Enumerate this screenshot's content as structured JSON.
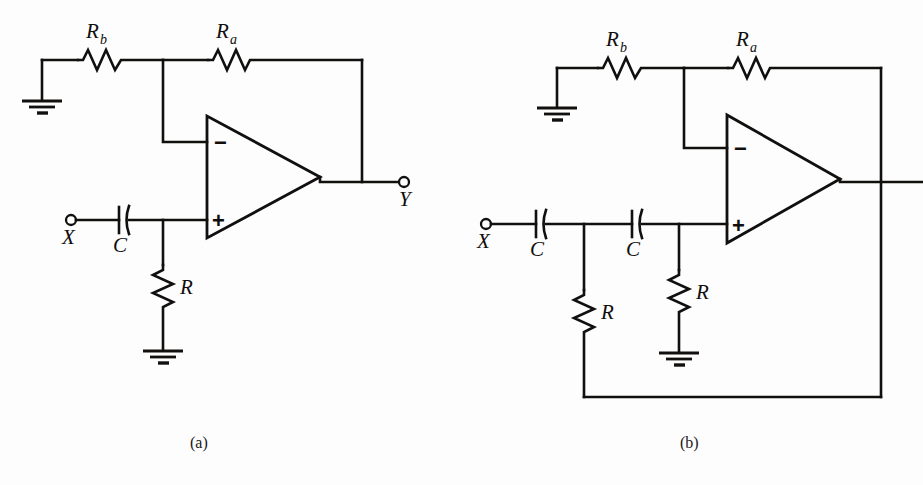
{
  "figure": {
    "kind": "circuit-schematic-figure",
    "panels": [
      {
        "id": "a",
        "caption": "(a)",
        "title_hint": "single-section active filter",
        "input_terminal": "X",
        "output_terminal": "Y",
        "components": [
          {
            "ref": "Rb",
            "type": "resistor",
            "label": "R",
            "sub": "b"
          },
          {
            "ref": "Ra",
            "type": "resistor",
            "label": "R",
            "sub": "a"
          },
          {
            "ref": "C1",
            "type": "capacitor",
            "label": "C",
            "sub": ""
          },
          {
            "ref": "R1",
            "type": "resistor",
            "label": "R",
            "sub": ""
          }
        ],
        "opamp": {
          "minus": "−",
          "plus": "+"
        },
        "ground_count": 2
      },
      {
        "id": "b",
        "caption": "(b)",
        "title_hint": "two-section active filter",
        "input_terminal": "X",
        "output_terminal": "",
        "components": [
          {
            "ref": "Rb",
            "type": "resistor",
            "label": "R",
            "sub": "b"
          },
          {
            "ref": "Ra",
            "type": "resistor",
            "label": "R",
            "sub": "a"
          },
          {
            "ref": "C1",
            "type": "capacitor",
            "label": "C",
            "sub": ""
          },
          {
            "ref": "C2",
            "type": "capacitor",
            "label": "C",
            "sub": ""
          },
          {
            "ref": "R1",
            "type": "resistor",
            "label": "R",
            "sub": ""
          },
          {
            "ref": "R2",
            "type": "resistor",
            "label": "R",
            "sub": ""
          }
        ],
        "opamp": {
          "minus": "−",
          "plus": "+"
        },
        "ground_count": 2
      }
    ],
    "colors": {
      "ink": "#12100f",
      "paper": "#fdfdfd"
    }
  },
  "panel_a": {
    "caption": "(a)",
    "label_Rb": "R",
    "label_Rb_sub": "b",
    "label_Ra": "R",
    "label_Ra_sub": "a",
    "label_C": "C",
    "label_R": "R",
    "terminal_X": "X",
    "terminal_Y": "Y",
    "opamp_minus": "−",
    "opamp_plus": "+"
  },
  "panel_b": {
    "caption": "(b)",
    "label_Rb": "R",
    "label_Rb_sub": "b",
    "label_Ra": "R",
    "label_Ra_sub": "a",
    "label_C1": "C",
    "label_C2": "C",
    "label_R1": "R",
    "label_R2": "R",
    "terminal_X": "X",
    "opamp_minus": "−",
    "opamp_plus": "+"
  }
}
